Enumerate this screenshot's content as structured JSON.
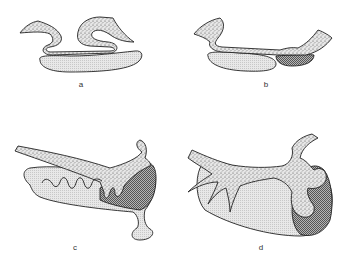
{
  "figure": {
    "panels": [
      {
        "id": "a",
        "label": "a",
        "x": 81,
        "y": 80
      },
      {
        "id": "b",
        "label": "b",
        "x": 266,
        "y": 80
      },
      {
        "id": "c",
        "label": "c",
        "x": 75,
        "y": 243
      },
      {
        "id": "d",
        "label": "d",
        "x": 261,
        "y": 243
      }
    ],
    "colors": {
      "outline": "#222222",
      "stipple_bg": "#e4e4e4",
      "light_fill": "#dcdcdc",
      "dark_fill": "#8c8c8c"
    }
  }
}
